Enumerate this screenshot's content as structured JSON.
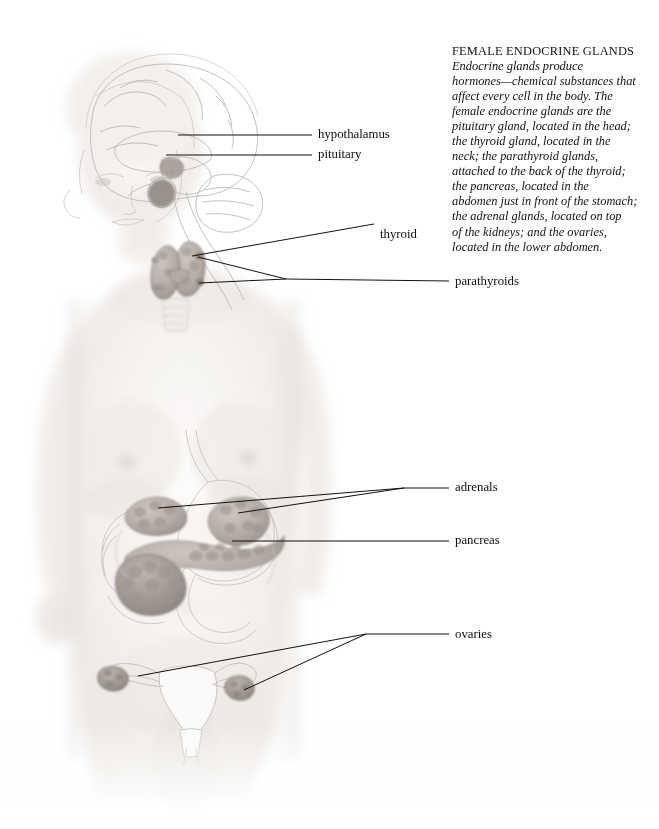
{
  "figure": {
    "view": "anterior female figure with brain sagittal section, thyroid, pancreas, adrenals, uterus and ovaries"
  },
  "caption": {
    "title": "FEMALE ENDOCRINE GLANDS",
    "body_lines": [
      "Endocrine glands produce",
      "hormones—chemical substances that",
      "affect every cell in the body. The",
      "female endocrine glands are the",
      "pituitary gland, located in the head;",
      "the thyroid gland, located in the",
      "neck; the parathyroid glands,",
      "attached to the back of the thyroid;",
      "the pancreas, located in the",
      "abdomen just in front of the stomach;",
      "the adrenal glands, located on top",
      "of the kidneys; and the ovaries,",
      "located in the lower abdomen."
    ]
  },
  "labels": [
    {
      "id": "hypothalamus",
      "text": "hypothalamus",
      "x": 318,
      "y": 128
    },
    {
      "id": "pituitary",
      "text": "pituitary",
      "x": 318,
      "y": 148
    },
    {
      "id": "thyroid",
      "text": "thyroid",
      "x": 380,
      "y": 228
    },
    {
      "id": "parathyroids",
      "text": "parathyroids",
      "x": 455,
      "y": 275
    },
    {
      "id": "adrenals",
      "text": "adrenals",
      "x": 455,
      "y": 481
    },
    {
      "id": "pancreas",
      "text": "pancreas",
      "x": 455,
      "y": 534
    },
    {
      "id": "ovaries",
      "text": "ovaries",
      "x": 455,
      "y": 628
    }
  ],
  "colors": {
    "background": "#ffffff",
    "text": "#111111",
    "leader_line": "#111111",
    "gland_fill": "#b9b2ab",
    "gland_outline": "#6b655f",
    "skin_light": "#f7f5f3",
    "skin_mid": "#ebe7e3",
    "skin_shadow": "#ddd8d3",
    "line_art": "#c8c4c0"
  }
}
